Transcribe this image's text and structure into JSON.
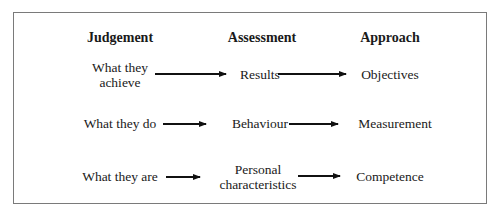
{
  "headers": {
    "judgement": "Judgement",
    "assessment": "Assessment",
    "approach": "Approach"
  },
  "rows": [
    {
      "judgement": [
        "What they",
        "achieve"
      ],
      "assessment": [
        "Results"
      ],
      "approach": [
        "Objectives"
      ]
    },
    {
      "judgement": [
        "What they do"
      ],
      "assessment": [
        "Behaviour"
      ],
      "approach": [
        "Measurement"
      ]
    },
    {
      "judgement": [
        "What they are"
      ],
      "assessment": [
        "Personal",
        "characteristics"
      ],
      "approach": [
        "Competence"
      ]
    }
  ],
  "colors": {
    "text": "#1a1a1a",
    "frame": "#7a7a7a",
    "arrow": "#111111"
  }
}
